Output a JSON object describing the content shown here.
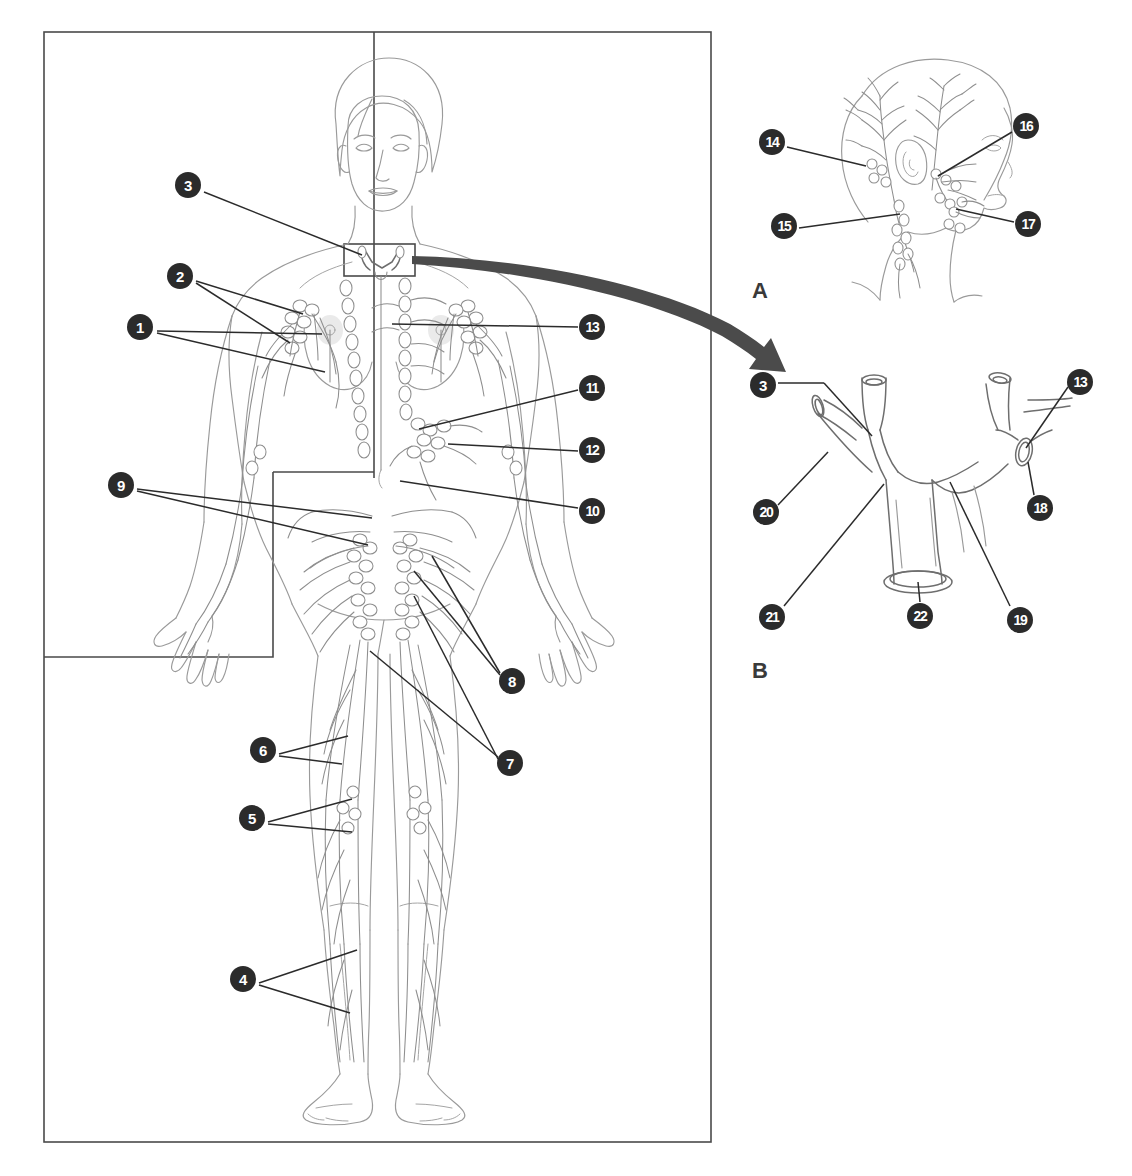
{
  "figure": {
    "panels": [
      {
        "id": "main",
        "letter": ""
      },
      {
        "id": "head",
        "letter": "A"
      },
      {
        "id": "duct",
        "letter": "B"
      }
    ]
  },
  "colors": {
    "bullet_fill": "#2b2b2b",
    "bullet_text": "#ffffff",
    "leader_line": "#2b2b2b",
    "frame": "#4a4a4a",
    "anatomy_line": "#9a9a9a",
    "arrow": "#4b4b4b"
  },
  "panel_letters": {
    "head": "A",
    "duct": "B"
  },
  "main_panel": {
    "name": "whole-body-lymphatic-diagram",
    "callouts": [
      {
        "number": "1",
        "x": 140,
        "y": 327,
        "side": "left",
        "targets": [
          [
            325,
            370
          ],
          [
            322,
            332
          ]
        ]
      },
      {
        "number": "2",
        "x": 180,
        "y": 276,
        "side": "left",
        "targets": [
          [
            303,
            313
          ],
          [
            290,
            340
          ]
        ]
      },
      {
        "number": "3",
        "x": 188,
        "y": 185,
        "side": "left",
        "targets": [
          [
            360,
            253
          ]
        ]
      },
      {
        "number": "4",
        "x": 243,
        "y": 979,
        "side": "left",
        "targets": [
          [
            355,
            951
          ],
          [
            348,
            1010
          ]
        ]
      },
      {
        "number": "5",
        "x": 252,
        "y": 818,
        "side": "left",
        "targets": [
          [
            352,
            800
          ],
          [
            352,
            830
          ]
        ]
      },
      {
        "number": "6",
        "x": 263,
        "y": 750,
        "side": "left",
        "targets": [
          [
            348,
            735
          ],
          [
            340,
            760
          ]
        ]
      },
      {
        "number": "7",
        "x": 510,
        "y": 763,
        "side": "right",
        "targets": [
          [
            368,
            650
          ],
          [
            412,
            595
          ]
        ]
      },
      {
        "number": "8",
        "x": 512,
        "y": 681,
        "side": "right",
        "targets": [
          [
            413,
            570
          ],
          [
            430,
            555
          ]
        ]
      },
      {
        "number": "9",
        "x": 121,
        "y": 485,
        "side": "left",
        "targets": [
          [
            372,
            517
          ],
          [
            368,
            543
          ]
        ]
      },
      {
        "number": "10",
        "x": 592,
        "y": 511,
        "side": "right",
        "targets": [
          [
            400,
            480
          ]
        ]
      },
      {
        "number": "11",
        "x": 592,
        "y": 388,
        "side": "right",
        "targets": [
          [
            417,
            428
          ]
        ]
      },
      {
        "number": "12",
        "x": 592,
        "y": 450,
        "side": "right",
        "targets": [
          [
            518,
            437
          ]
        ]
      },
      {
        "number": "13",
        "x": 592,
        "y": 327,
        "side": "right",
        "targets": [
          [
            393,
            323
          ]
        ]
      }
    ]
  },
  "head_panel": {
    "name": "head-and-neck-lymphatics",
    "letter": "A",
    "letter_x": 752,
    "letter_y": 278,
    "callouts": [
      {
        "number": "14",
        "x": 772,
        "y": 142,
        "side": "left",
        "targets": [
          [
            858,
            160
          ]
        ]
      },
      {
        "number": "15",
        "x": 784,
        "y": 226,
        "side": "left",
        "targets": [
          [
            900,
            213
          ]
        ]
      },
      {
        "number": "16",
        "x": 1026,
        "y": 126,
        "side": "right",
        "targets": [
          [
            936,
            170
          ]
        ]
      },
      {
        "number": "17",
        "x": 1028,
        "y": 224,
        "side": "right",
        "targets": [
          [
            953,
            206
          ]
        ]
      }
    ]
  },
  "duct_panel": {
    "name": "thoracic-duct-termination",
    "letter": "B",
    "letter_x": 752,
    "letter_y": 658,
    "callouts": [
      {
        "number": "3",
        "x": 763,
        "y": 385,
        "side": "left",
        "targets": [
          [
            871,
            434
          ]
        ]
      },
      {
        "number": "13",
        "x": 1080,
        "y": 382,
        "side": "right",
        "targets": [
          [
            1028,
            447
          ]
        ]
      },
      {
        "number": "18",
        "x": 1040,
        "y": 508,
        "side": "right",
        "targets": [
          [
            1032,
            461
          ]
        ]
      },
      {
        "number": "19",
        "x": 1020,
        "y": 620,
        "side": "right",
        "targets": [
          [
            954,
            485
          ]
        ]
      },
      {
        "number": "20",
        "x": 766,
        "y": 512,
        "side": "left",
        "targets": [
          [
            831,
            450
          ]
        ]
      },
      {
        "number": "21",
        "x": 772,
        "y": 617,
        "side": "left",
        "targets": [
          [
            886,
            483
          ]
        ]
      },
      {
        "number": "22",
        "x": 920,
        "y": 616,
        "side": "left",
        "targets": [
          [
            918,
            580
          ]
        ]
      }
    ]
  },
  "frames": {
    "outer": {
      "x": 44,
      "y": 32,
      "w": 667,
      "h": 1110
    },
    "inner_vertical_x": 374,
    "inner_vertical_y1": 32,
    "inner_vertical_y2": 478,
    "inset_box": {
      "x": 44,
      "y": 472,
      "w": 229,
      "h": 185
    },
    "neck_detail_box": {
      "x": 344,
      "y": 244,
      "w": 71,
      "h": 32
    }
  },
  "arrow": {
    "name": "zoom-arrow-to-panel-b",
    "from_x": 413,
    "from_y": 258,
    "to_x": 784,
    "to_y": 362
  }
}
